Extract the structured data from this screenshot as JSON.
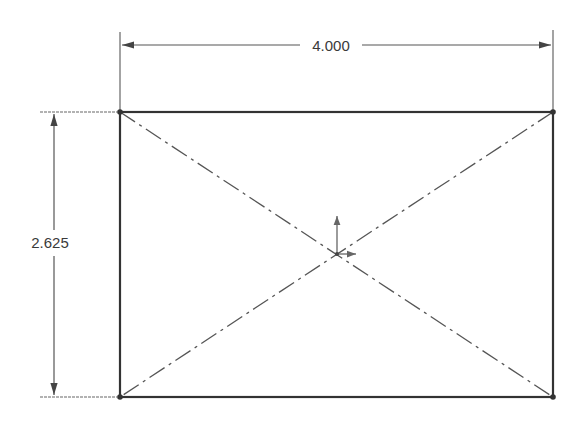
{
  "drawing": {
    "type": "sketch-rectangle-with-construction-diagonals",
    "rectangle": {
      "x1": 120,
      "y1": 112,
      "x2": 553,
      "y2": 397
    },
    "center": {
      "x": 337,
      "y": 254
    },
    "colors": {
      "line": "#333333",
      "construction": "#555555",
      "dimension": "#444444"
    }
  },
  "dimensions": {
    "width": {
      "label": "4.000"
    },
    "height": {
      "label": "2.625"
    }
  },
  "icons": {
    "origin": "origin-axis-icon"
  }
}
